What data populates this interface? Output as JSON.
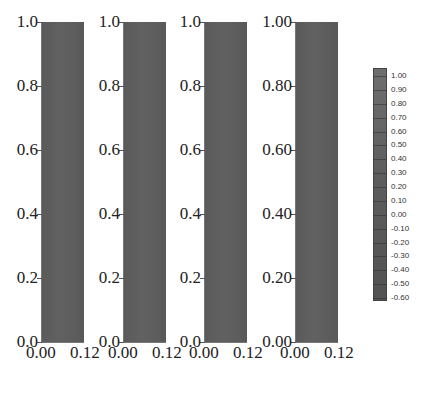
{
  "chart_data": {
    "type": "heatmap",
    "title": "",
    "panels": [
      {
        "x_ticks": [
          "0.00",
          "0.12"
        ],
        "y_ticks": [
          "0.0",
          "0.2",
          "0.4",
          "0.6",
          "0.8",
          "1.0"
        ],
        "xlim": [
          0,
          0.12
        ],
        "ylim": [
          0,
          1.0
        ]
      },
      {
        "x_ticks": [
          "0.00",
          "0.12"
        ],
        "y_ticks": [
          "0.0",
          "0.2",
          "0.4",
          "0.6",
          "0.8",
          "1.0"
        ],
        "xlim": [
          0,
          0.12
        ],
        "ylim": [
          0,
          1.0
        ]
      },
      {
        "x_ticks": [
          "0.00",
          "0.12"
        ],
        "y_ticks": [
          "0.0",
          "0.2",
          "0.4",
          "0.6",
          "0.8",
          "1.0"
        ],
        "xlim": [
          0,
          0.12
        ],
        "ylim": [
          0,
          1.0
        ]
      },
      {
        "x_ticks": [
          "0.00",
          "0.12"
        ],
        "y_ticks": [
          "0.00",
          "0.20",
          "0.40",
          "0.60",
          "0.80",
          "1.00"
        ],
        "xlim": [
          0,
          0.12
        ],
        "ylim": [
          0,
          1.0
        ]
      }
    ],
    "colorbar": {
      "ticks": [
        "1.00",
        "0.90",
        "0.80",
        "0.70",
        "0.60",
        "0.50",
        "0.40",
        "0.30",
        "0.20",
        "0.10",
        "0.00",
        "-0.10",
        "-0.20",
        "-0.30",
        "-0.40",
        "-0.50",
        "-0.60"
      ],
      "range": [
        -0.6,
        1.0
      ],
      "colormap": "grayscale"
    },
    "grid": false,
    "legend_position": "right"
  }
}
